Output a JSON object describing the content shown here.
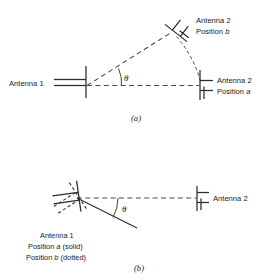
{
  "figure": {
    "background_color": "#ffffff",
    "line_color": "#2b2b2b",
    "dash_color": "#4a4a4a"
  },
  "panel_a": {
    "caption": "(a)",
    "angle_symbol": "θ",
    "labels": {
      "antenna1": "Antenna 1",
      "antenna2_line1": "Antenna 2",
      "antenna2_line2_prefix": "Position ",
      "antenna2_line2_italic": "a",
      "antenna2b_line1": "Antenna 2",
      "antenna2b_line2_prefix": "Position ",
      "antenna2b_line2_italic": "b"
    }
  },
  "panel_b": {
    "caption": "(b)",
    "angle_symbol": "θ",
    "labels": {
      "antenna2": "Antenna 2",
      "antenna1": "Antenna 1",
      "position_a_prefix": "Position ",
      "position_a_italic": "a",
      "position_a_suffix": " (solid)",
      "position_b_prefix": "Position ",
      "position_b_italic": "b",
      "position_b_suffix": " (dotted)"
    }
  }
}
